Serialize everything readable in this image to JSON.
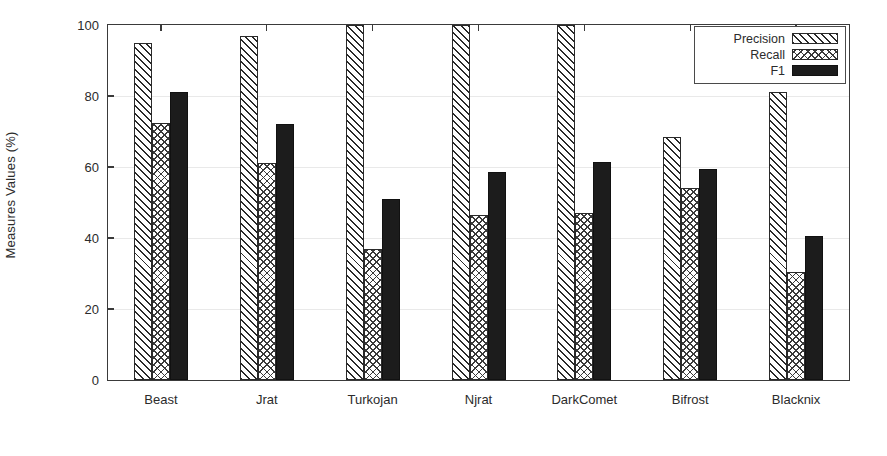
{
  "chart_data": {
    "type": "bar",
    "title": "",
    "subtitle": "",
    "xlabel": "",
    "ylabel": "Measures Values (%)",
    "categories": [
      "Beast",
      "Jrat",
      "Turkojan",
      "Njrat",
      "DarkComet",
      "Bifrost",
      "Blacknix"
    ],
    "series": [
      {
        "name": "Precision",
        "pattern": "diagonal-hatch",
        "values": [
          95.0,
          97.0,
          100.0,
          100.0,
          100.0,
          68.5,
          81.0
        ]
      },
      {
        "name": "Recall",
        "pattern": "cross-hatch",
        "values": [
          72.5,
          61.0,
          37.0,
          46.5,
          47.0,
          54.0,
          30.5
        ]
      },
      {
        "name": "F1",
        "pattern": "solid-fill",
        "values": [
          81.0,
          72.0,
          51.0,
          58.5,
          61.5,
          59.5,
          40.5
        ]
      }
    ],
    "ylim": [
      0,
      100
    ],
    "yticks": [
      0,
      20,
      40,
      60,
      80,
      100
    ],
    "ytick_labels": [
      "0",
      "20",
      "40",
      "60",
      "80",
      "100"
    ],
    "grid": true,
    "grid_axis": "y",
    "legend_position": "top-right",
    "colors": {
      "axis": "#3a3a3a",
      "grid": "#e9e9e9",
      "text": "#2b2b2b",
      "f1_fill": "#1c1c1c",
      "hatch": "#2a2a2a",
      "background": "#ffffff"
    }
  },
  "legend": {
    "items": [
      {
        "label": "Precision",
        "swatch": "diagonal-hatch-swatch"
      },
      {
        "label": "Recall",
        "swatch": "cross-hatch-swatch"
      },
      {
        "label": "F1",
        "swatch": "solid-black-swatch"
      }
    ]
  }
}
